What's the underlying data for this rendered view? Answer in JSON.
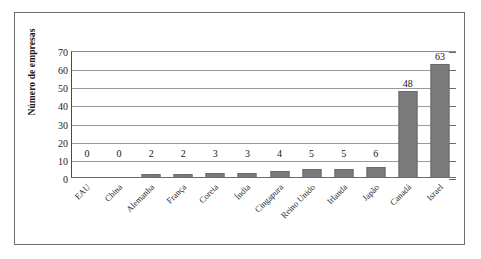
{
  "chart_data": {
    "type": "bar",
    "title": "",
    "xlabel": "",
    "ylabel": "Número de empresas",
    "ylim": [
      0,
      70
    ],
    "yticks": [
      0,
      10,
      20,
      30,
      40,
      50,
      60,
      70
    ],
    "grid": true,
    "legend": false,
    "orientation": "vertical",
    "bar_color": "#7b7b7b",
    "categories": [
      "EAU",
      "China",
      "Alemanha",
      "França",
      "Coreia",
      "Índia",
      "Cingapura",
      "Reino Unido",
      "Irlanda",
      "Japão",
      "Canadá",
      "Israel"
    ],
    "values": [
      0,
      0,
      2,
      2,
      3,
      3,
      4,
      5,
      5,
      6,
      48,
      63
    ],
    "value_labels": [
      "0",
      "0",
      "2",
      "2",
      "3",
      "3",
      "4",
      "5",
      "5",
      "6",
      "48",
      "63"
    ]
  },
  "axes": {
    "y_title": "Número de empresas",
    "y_tick_labels": [
      "70",
      "60",
      "50",
      "40",
      "30",
      "20",
      "10",
      "0"
    ]
  }
}
